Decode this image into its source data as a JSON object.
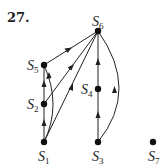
{
  "problem_number": "27.",
  "nodes": [
    {
      "id": "S1",
      "base": "S",
      "sub": "1",
      "x": 44,
      "y": 142,
      "label_x": 38,
      "label_y": 161
    },
    {
      "id": "S2",
      "base": "S",
      "sub": "2",
      "x": 44,
      "y": 104,
      "label_x": 26,
      "label_y": 109
    },
    {
      "id": "S3",
      "base": "S",
      "sub": "3",
      "x": 98,
      "y": 142,
      "label_x": 92,
      "label_y": 161
    },
    {
      "id": "S4",
      "base": "S",
      "sub": "4",
      "x": 98,
      "y": 89,
      "label_x": 80,
      "label_y": 94
    },
    {
      "id": "S5",
      "base": "S",
      "sub": "5",
      "x": 44,
      "y": 65,
      "label_x": 26,
      "label_y": 70
    },
    {
      "id": "S6",
      "base": "S",
      "sub": "6",
      "x": 98,
      "y": 31,
      "label_x": 92,
      "label_y": 26
    },
    {
      "id": "S7",
      "base": "S",
      "sub": "7",
      "x": 153,
      "y": 142,
      "label_x": 148,
      "label_y": 161
    }
  ],
  "edges": [
    {
      "from": "S1",
      "to": "S2",
      "type": "straight"
    },
    {
      "from": "S2",
      "to": "S5",
      "type": "straight"
    },
    {
      "from": "S1",
      "to": "S5",
      "type": "curved"
    },
    {
      "from": "S5",
      "to": "S6",
      "type": "straight"
    },
    {
      "from": "S2",
      "to": "S6",
      "type": "straight"
    },
    {
      "from": "S1",
      "to": "S6",
      "type": "straight"
    },
    {
      "from": "S3",
      "to": "S4",
      "type": "straight"
    },
    {
      "from": "S4",
      "to": "S6",
      "type": "straight"
    },
    {
      "from": "S3",
      "to": "S6",
      "type": "curved"
    }
  ]
}
